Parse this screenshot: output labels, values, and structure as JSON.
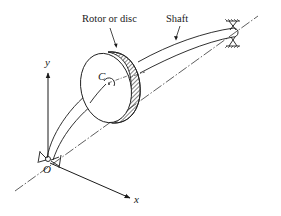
{
  "diagram": {
    "type": "engineering-schematic",
    "labels": {
      "rotor": "Rotor or disc",
      "shaft": "Shaft",
      "center": "C",
      "origin": "O",
      "x_axis": "x",
      "y_axis": "y"
    },
    "elements": [
      {
        "name": "rotor-disc",
        "description": "Disc with hatched rim, centre of mass C"
      },
      {
        "name": "shaft",
        "description": "Curved (deflected) shaft from O to right bearing"
      },
      {
        "name": "left-bearing",
        "description": "Support bearing at origin O"
      },
      {
        "name": "right-bearing",
        "description": "Support bearing at far end of shaft"
      },
      {
        "name": "bearing-axis",
        "description": "Dash-dot straight line joining bearings (undeflected axis)"
      },
      {
        "name": "x-axis",
        "description": "Coordinate axis x"
      },
      {
        "name": "y-axis",
        "description": "Coordinate axis y"
      }
    ],
    "colors": {
      "ink": "#1a1a1a",
      "background": "#ffffff"
    }
  }
}
